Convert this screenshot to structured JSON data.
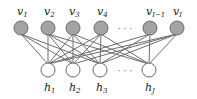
{
  "diagram": {
    "type": "bipartite-network",
    "visible_layer": {
      "nodes": [
        {
          "id": "v1",
          "base": "v",
          "sub": "1",
          "x": 21,
          "y": 28
        },
        {
          "id": "v2",
          "base": "v",
          "sub": "2",
          "x": 48,
          "y": 28
        },
        {
          "id": "v3",
          "base": "v",
          "sub": "3",
          "x": 73,
          "y": 28
        },
        {
          "id": "v4",
          "base": "v",
          "sub": "4",
          "x": 101,
          "y": 28
        },
        {
          "id": "vI-1",
          "base": "v",
          "sub": "I−1",
          "x": 150,
          "y": 28
        },
        {
          "id": "vI",
          "base": "v",
          "sub": "I",
          "x": 177,
          "y": 28
        }
      ],
      "ellipsis": "· · ·",
      "fill_color": "#a3a3a3"
    },
    "hidden_layer": {
      "nodes": [
        {
          "id": "h1",
          "base": "h",
          "sub": "1",
          "x": 48,
          "y": 70
        },
        {
          "id": "h2",
          "base": "h",
          "sub": "2",
          "x": 73,
          "y": 70
        },
        {
          "id": "h3",
          "base": "h",
          "sub": "3",
          "x": 100,
          "y": 70
        },
        {
          "id": "hJ",
          "base": "h",
          "sub": "J",
          "x": 149,
          "y": 70
        }
      ],
      "ellipsis": "· · ·",
      "fill_color": "#ffffff"
    },
    "edges": [
      [
        "v1",
        "h1"
      ],
      [
        "v1",
        "h2"
      ],
      [
        "v1",
        "h3"
      ],
      [
        "v2",
        "h1"
      ],
      [
        "v2",
        "h2"
      ],
      [
        "v2",
        "h3"
      ],
      [
        "v2",
        "hJ"
      ],
      [
        "v3",
        "h1"
      ],
      [
        "v3",
        "h2"
      ],
      [
        "v3",
        "h3"
      ],
      [
        "v3",
        "hJ"
      ],
      [
        "v4",
        "h1"
      ],
      [
        "v4",
        "h2"
      ],
      [
        "v4",
        "h3"
      ],
      [
        "v4",
        "hJ"
      ],
      [
        "vI-1",
        "h1"
      ],
      [
        "vI-1",
        "h3"
      ],
      [
        "vI-1",
        "hJ"
      ],
      [
        "vI",
        "h1"
      ],
      [
        "vI",
        "h2"
      ],
      [
        "vI",
        "h3"
      ],
      [
        "vI",
        "hJ"
      ]
    ],
    "edge_color": "#6e6e6e"
  }
}
